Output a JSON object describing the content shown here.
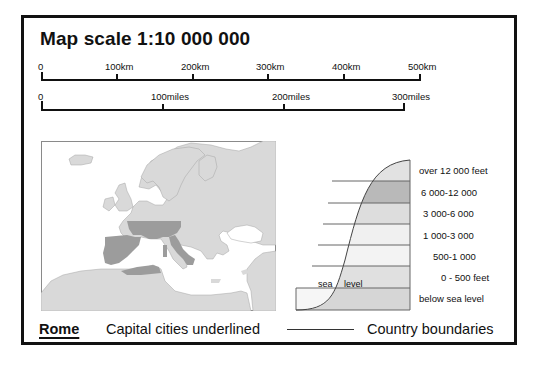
{
  "title": "Map scale 1:10 000 000",
  "km_scale": {
    "labels": [
      "0",
      "100km",
      "200km",
      "300km",
      "400km",
      "500km"
    ]
  },
  "miles_scale": {
    "labels": [
      "0",
      "100miles",
      "200miles",
      "300miles"
    ]
  },
  "elevation": {
    "bands": [
      {
        "label": "over 12 000 feet",
        "fill": "#e2e2e2"
      },
      {
        "label": "6 000-12 000",
        "fill": "#b9b9b9"
      },
      {
        "label": "3 000-6 000",
        "fill": "#dddddd"
      },
      {
        "label": "1 000-3 000",
        "fill": "#f0f0f0"
      },
      {
        "label": "500-1 000",
        "fill": "#f3f3f3"
      },
      {
        "label": "0 - 500 feet",
        "fill": "#e0e0e0"
      },
      {
        "label": "below sea level",
        "fill": "#d6d6d6"
      }
    ],
    "sea_word": "sea",
    "level_word": "level"
  },
  "legend": {
    "capital_example": "Rome",
    "capital_text": "Capital cities underlined",
    "boundary_text": "Country boundaries"
  },
  "colors": {
    "land": "#d9d9d9",
    "highlight": "#9c9c9c",
    "sea": "#ffffff",
    "frame": "#111111"
  }
}
